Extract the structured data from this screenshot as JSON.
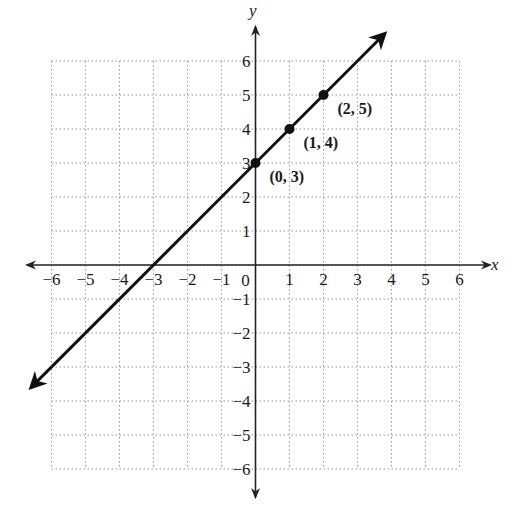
{
  "chart_data": {
    "type": "line",
    "title": "",
    "xlabel": "x",
    "ylabel": "y",
    "xlim": [
      -6,
      6
    ],
    "ylim": [
      -6,
      6
    ],
    "grid": true,
    "grid_style": "dotted",
    "x_ticks": [
      -6,
      -5,
      -4,
      -3,
      -2,
      -1,
      0,
      1,
      2,
      3,
      4,
      5,
      6
    ],
    "y_ticks": [
      -6,
      -5,
      -4,
      -3,
      -2,
      -1,
      1,
      2,
      3,
      4,
      5,
      6
    ],
    "x_tick_labels": [
      "−6",
      "−5",
      "−4",
      "−3",
      "−2",
      "−1",
      "0",
      "1",
      "2",
      "3",
      "4",
      "5",
      "6"
    ],
    "y_tick_labels": [
      "−6",
      "−5",
      "−4",
      "−3",
      "−2",
      "−1",
      "1",
      "2",
      "3",
      "4",
      "5",
      "6"
    ],
    "series": [
      {
        "name": "y = x + 3",
        "equation": {
          "slope": 1,
          "intercept": 3
        },
        "x": [
          -6.6,
          3.8
        ],
        "y": [
          -3.6,
          6.8
        ],
        "arrows_both_ends": true
      }
    ],
    "points": [
      {
        "x": 0,
        "y": 3,
        "label": "(0, 3)"
      },
      {
        "x": 1,
        "y": 4,
        "label": "(1, 4)"
      },
      {
        "x": 2,
        "y": 5,
        "label": "(2, 5)"
      }
    ],
    "colors": {
      "line": "#111111",
      "grid": "#9a9a9a",
      "axis": "#222222",
      "background": "#ffffff"
    }
  }
}
